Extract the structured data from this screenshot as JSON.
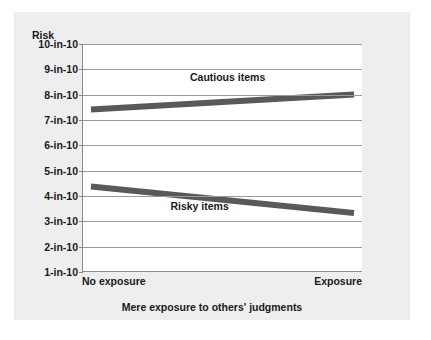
{
  "chart_data": {
    "type": "line",
    "title": "",
    "ylabel": "Risk",
    "xlabel": "Mere exposure to others' judgments",
    "categories": [
      "No exposure",
      "Exposure"
    ],
    "ytick_labels": [
      "10-in-10",
      "9-in-10",
      "8-in-10",
      "7-in-10",
      "6-in-10",
      "5-in-10",
      "4-in-10",
      "3-in-10",
      "2-in-10",
      "1-in-10"
    ],
    "ytick_values": [
      10,
      9,
      8,
      7,
      6,
      5,
      4,
      3,
      2,
      1
    ],
    "ylim": [
      1,
      10
    ],
    "grid": true,
    "legend_position": "inline-annotations",
    "series": [
      {
        "name": "Cautious items",
        "values": [
          7.4,
          8.0
        ],
        "color": "#595959",
        "label_x_frac": 0.52,
        "label_y_value": 8.7
      },
      {
        "name": "Risky items",
        "values": [
          4.35,
          3.3
        ],
        "color": "#595959",
        "label_x_frac": 0.42,
        "label_y_value": 3.62
      }
    ],
    "colors": {
      "panel_background": "#eeeeee",
      "plot_background": "#ffffff",
      "gridline": "#9a9a9a",
      "axis": "#8a8a8a",
      "text": "#1a1a1a",
      "line": "#595959"
    }
  }
}
